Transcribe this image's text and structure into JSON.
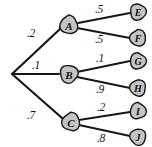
{
  "diagram": {
    "type": "probability-tree",
    "background_color": "#ffffff",
    "node_fill_color": "#c4c4c4",
    "node_stroke_color": "#151515",
    "edge_color": "#171717",
    "root": {
      "id": "root",
      "label": "",
      "x": 11,
      "y": 74
    },
    "nodes": [
      {
        "id": "A",
        "label": "A",
        "x": 69,
        "y": 25,
        "r": 9.5,
        "font_size": 11
      },
      {
        "id": "B",
        "label": "B",
        "x": 69,
        "y": 74,
        "r": 9.5,
        "font_size": 11
      },
      {
        "id": "C",
        "label": "C",
        "x": 71,
        "y": 122,
        "r": 9.5,
        "font_size": 11
      },
      {
        "id": "E",
        "label": "E",
        "x": 138,
        "y": 12,
        "r": 8.5,
        "font_size": 10
      },
      {
        "id": "F",
        "label": "F",
        "x": 138,
        "y": 38,
        "r": 8.5,
        "font_size": 10
      },
      {
        "id": "G",
        "label": "G",
        "x": 138,
        "y": 61,
        "r": 8.5,
        "font_size": 10
      },
      {
        "id": "H",
        "label": "H",
        "x": 138,
        "y": 88,
        "r": 8.5,
        "font_size": 10
      },
      {
        "id": "I",
        "label": "I",
        "x": 138,
        "y": 111,
        "r": 8.5,
        "font_size": 10
      },
      {
        "id": "J",
        "label": "J",
        "x": 138,
        "y": 137,
        "r": 8.5,
        "font_size": 10
      }
    ],
    "edges": [
      {
        "id": "root-A",
        "from": "root",
        "to": "A",
        "probability": ".2",
        "label_x": 31,
        "label_y": 33,
        "x1": 12,
        "y1": 74,
        "x2": 60,
        "y2": 29,
        "width": 2.2
      },
      {
        "id": "root-B",
        "from": "root",
        "to": "B",
        "probability": ".1",
        "label_x": 36,
        "label_y": 65,
        "x1": 12,
        "y1": 74,
        "x2": 59,
        "y2": 74,
        "width": 2.2
      },
      {
        "id": "root-C",
        "from": "root",
        "to": "C",
        "probability": ".7",
        "label_x": 31,
        "label_y": 115,
        "x1": 12,
        "y1": 74,
        "x2": 62,
        "y2": 118,
        "width": 2.2
      },
      {
        "id": "A-E",
        "from": "A",
        "to": "E",
        "probability": ".5",
        "label_x": 99,
        "label_y": 9,
        "x1": 78,
        "y1": 23,
        "x2": 130,
        "y2": 13,
        "width": 1.9
      },
      {
        "id": "A-F",
        "from": "A",
        "to": "F",
        "probability": ".5",
        "label_x": 99,
        "label_y": 39,
        "x1": 77,
        "y1": 28,
        "x2": 130,
        "y2": 38,
        "width": 1.9
      },
      {
        "id": "B-G",
        "from": "B",
        "to": "G",
        "probability": ".1",
        "label_x": 100,
        "label_y": 58,
        "x1": 77,
        "y1": 72,
        "x2": 130,
        "y2": 61,
        "width": 1.9
      },
      {
        "id": "B-H",
        "from": "B",
        "to": "H",
        "probability": ".9",
        "label_x": 100,
        "label_y": 89,
        "x1": 77,
        "y1": 77,
        "x2": 130,
        "y2": 88,
        "width": 1.9
      },
      {
        "id": "C-I",
        "from": "C",
        "to": "I",
        "probability": ".2",
        "label_x": 101,
        "label_y": 107,
        "x1": 79,
        "y1": 120,
        "x2": 130,
        "y2": 112,
        "width": 1.9
      },
      {
        "id": "C-J",
        "from": "C",
        "to": "J",
        "probability": ".8",
        "label_x": 101,
        "label_y": 138,
        "x1": 79,
        "y1": 125,
        "x2": 130,
        "y2": 136,
        "width": 1.9
      }
    ]
  }
}
